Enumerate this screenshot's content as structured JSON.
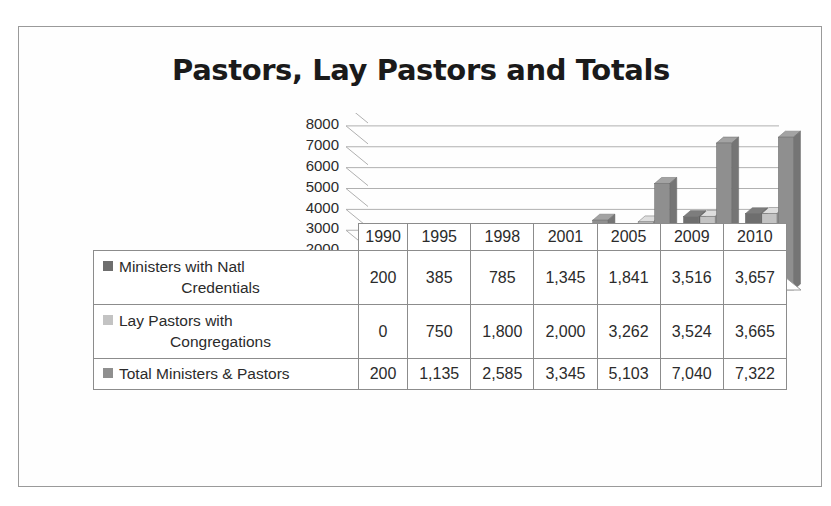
{
  "title": "Pastors, Lay Pastors and Totals",
  "colors": {
    "series1": "#6e6e6e",
    "series2": "#c3c3c3",
    "series3": "#8f8f8f",
    "axis": "#8c8c8c",
    "text": "#2b2b2b",
    "frame": "#9a9a9a"
  },
  "chart_data": {
    "type": "bar",
    "title": "Pastors, Lay Pastors and Totals",
    "xlabel": "",
    "ylabel": "",
    "ylim": [
      0,
      8000
    ],
    "yticks": [
      8000,
      7000,
      6000,
      5000,
      4000,
      3000,
      2000,
      1000,
      0
    ],
    "ytick_labels": [
      "8000",
      "7000",
      "6000",
      "5000",
      "4000",
      "3000",
      "2000",
      "1000",
      "0"
    ],
    "grid": true,
    "legend_position": "table-left",
    "three_d": true,
    "categories": [
      "1990",
      "1995",
      "1998",
      "2001",
      "2005",
      "2009",
      "2010"
    ],
    "series": [
      {
        "name": "Ministers with Natl Credentials",
        "color": "#6e6e6e",
        "values": [
          200,
          385,
          785,
          1345,
          1841,
          3516,
          3657
        ],
        "display": [
          "200",
          "385",
          "785",
          "1,345",
          "1,841",
          "3,516",
          "3,657"
        ]
      },
      {
        "name": "Lay Pastors with Congregations",
        "color": "#c3c3c3",
        "values": [
          0,
          750,
          1800,
          2000,
          3262,
          3524,
          3665
        ],
        "display": [
          "0",
          "750",
          "1,800",
          "2,000",
          "3,262",
          "3,524",
          "3,665"
        ]
      },
      {
        "name": "Total Ministers & Pastors",
        "color": "#8f8f8f",
        "values": [
          200,
          1135,
          2585,
          3345,
          5103,
          7040,
          7322
        ],
        "display": [
          "200",
          "1,135",
          "2,585",
          "3,345",
          "5,103",
          "7,040",
          "7,322"
        ]
      }
    ]
  },
  "table": {
    "year_header": [
      "1990",
      "1995",
      "1998",
      "2001",
      "2005",
      "2009",
      "2010"
    ],
    "rows": [
      {
        "label_line1": "Ministers with Natl",
        "label_line2": "Credentials",
        "swatch": "#6e6e6e",
        "values": [
          "200",
          "385",
          "785",
          "1,345",
          "1,841",
          "3,516",
          "3,657"
        ]
      },
      {
        "label_line1": "Lay Pastors with",
        "label_line2": "Congregations",
        "swatch": "#c3c3c3",
        "values": [
          "0",
          "750",
          "1,800",
          "2,000",
          "3,262",
          "3,524",
          "3,665"
        ]
      },
      {
        "label_line1": "Total Ministers & Pastors",
        "label_line2": "",
        "swatch": "#8f8f8f",
        "values": [
          "200",
          "1,135",
          "2,585",
          "3,345",
          "5,103",
          "7,040",
          "7,322"
        ]
      }
    ]
  }
}
